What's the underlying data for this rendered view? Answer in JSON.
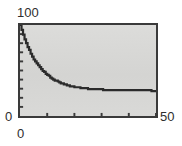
{
  "figure": {
    "background": "#ffffff",
    "plot_background": "#d6d6d4",
    "frame_color": "#3a3a3a",
    "curve_color": "#2b2b2b"
  },
  "labels": {
    "y_max": "100",
    "y_min": "0",
    "x_min": "0",
    "x_max": "50"
  },
  "chart_data": {
    "type": "line",
    "title": "",
    "xlabel": "",
    "ylabel": "",
    "xlim": [
      0,
      50
    ],
    "ylim": [
      0,
      100
    ],
    "grid": false,
    "legend": null,
    "xticks": [
      0,
      10,
      20,
      30,
      40,
      50
    ],
    "xtick_labels": [
      "0",
      "",
      "",
      "",
      "",
      "50"
    ],
    "yticks": [
      0,
      10,
      20,
      30,
      40,
      50,
      60,
      70,
      80,
      90,
      100
    ],
    "ytick_labels": [
      "0",
      "",
      "",
      "",
      "",
      "",
      "",
      "",
      "",
      "",
      "100"
    ],
    "series": [
      {
        "name": "decay",
        "x": [
          0,
          1,
          2,
          3,
          4,
          5,
          6,
          7,
          8,
          9,
          10,
          12,
          14,
          16,
          18,
          20,
          22,
          24,
          26,
          28,
          30,
          33,
          36,
          39,
          42,
          45,
          48,
          50
        ],
        "values": [
          100,
          90,
          81.5,
          74.2,
          68,
          62.6,
          58,
          54,
          50.6,
          47.6,
          45,
          40.7,
          37.5,
          35.1,
          33.3,
          32,
          31,
          30.2,
          29.7,
          29.3,
          29,
          28.6,
          28.4,
          28.2,
          28.1,
          28,
          27.9,
          27.8
        ]
      }
    ]
  }
}
